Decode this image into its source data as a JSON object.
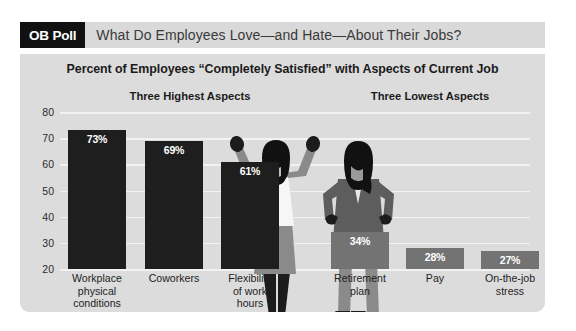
{
  "header": {
    "badge": "OB Poll",
    "title": "What Do Employees Love—and Hate—About Their Jobs?"
  },
  "panel": {
    "group_headers": {
      "highest": "Three Highest Aspects",
      "lowest": "Three Lowest Aspects"
    }
  },
  "colors": {
    "page_background": "#ffffff",
    "header_bar": "#d9d9d9",
    "badge_background": "#111111",
    "badge_text": "#ffffff",
    "panel_background": "#dcdcdc",
    "gridline": "#f2f2f2",
    "bar_high": "#1e1e1e",
    "bar_low": "#737373",
    "bar_value_text": "#ffffff",
    "axis_text": "#2c2c2c",
    "figure_dark": "#1c1c1c",
    "figure_gray": "#8a8a8a",
    "figure_midgray": "#646464",
    "figure_light": "#f4f4f4"
  },
  "chart_data": {
    "type": "bar",
    "title": "Percent of Employees “Completely Satisfied” with Aspects of Current Job",
    "xlabel": "",
    "ylabel": "",
    "ylim": [
      20,
      80
    ],
    "grid": true,
    "legend": "none",
    "ytick_labels": [
      "80",
      "70",
      "60",
      "50",
      "40",
      "30",
      "20"
    ],
    "ytick_values": [
      80,
      70,
      60,
      50,
      40,
      30,
      20
    ],
    "categories": [
      "Workplace physical conditions",
      "Coworkers",
      "Flexibility of work hours",
      "Retirement plan",
      "Pay",
      "On-the-job stress"
    ],
    "values": [
      73,
      69,
      61,
      34,
      28,
      27
    ],
    "value_labels": [
      "73%",
      "69%",
      "61%",
      "34%",
      "28%",
      "27%"
    ],
    "groups": [
      {
        "name": "Three Highest Aspects",
        "categories": [
          "Workplace physical conditions",
          "Coworkers",
          "Flexibility of work hours"
        ],
        "values": [
          73,
          69,
          61
        ],
        "color": "#1e1e1e"
      },
      {
        "name": "Three Lowest Aspects",
        "categories": [
          "Retirement plan",
          "Pay",
          "On-the-job stress"
        ],
        "values": [
          34,
          28,
          27
        ],
        "color": "#737373"
      }
    ]
  },
  "bars": [
    {
      "label_lines": [
        "Workplace",
        "physical",
        "conditions"
      ],
      "value_label": "73%",
      "value": 73,
      "group": "high"
    },
    {
      "label_lines": [
        "Coworkers"
      ],
      "value_label": "69%",
      "value": 69,
      "group": "high"
    },
    {
      "label_lines": [
        "Flexibility",
        "of work",
        "hours"
      ],
      "value_label": "61%",
      "value": 61,
      "group": "high"
    },
    {
      "label_lines": [
        "Retirement",
        "plan"
      ],
      "value_label": "34%",
      "value": 34,
      "group": "low"
    },
    {
      "label_lines": [
        "Pay"
      ],
      "value_label": "28%",
      "value": 28,
      "group": "low"
    },
    {
      "label_lines": [
        "On-the-job",
        "stress"
      ],
      "value_label": "27%",
      "value": 27,
      "group": "low"
    }
  ],
  "illustration": {
    "left_figure": "cheering-employee-figure",
    "right_figure": "frustrated-employee-figure"
  }
}
